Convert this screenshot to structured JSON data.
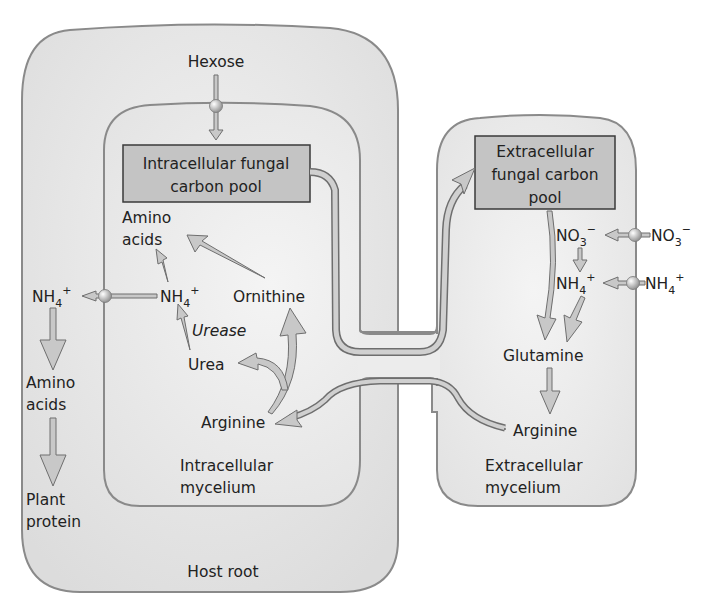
{
  "colors": {
    "host_fill": "#e4e4e4",
    "mycelium_fill": "#ececec",
    "outline": "#8a8a8a",
    "box_fill": "#c4c4c4",
    "box_border": "#3a3a3a",
    "arrow_fill": "#c8c8c8",
    "arrow_stroke": "#6e6e6e",
    "text": "#222222"
  },
  "regions": {
    "host_root": "Host root",
    "intracellular_mycelium": [
      "Intracellular",
      "mycelium"
    ],
    "extracellular_mycelium": [
      "Extracellular",
      "mycelium"
    ]
  },
  "boxes": {
    "intracellular_pool": [
      "Intracellular fungal",
      "carbon pool"
    ],
    "extracellular_pool": [
      "Extracellular",
      "fungal carbon",
      "pool"
    ]
  },
  "labels": {
    "hexose": "Hexose",
    "amino_acids_fungal": [
      "Amino",
      "acids"
    ],
    "nh4_intra": "NH",
    "nh4_host": "NH",
    "ornithine": "Ornithine",
    "urease": "Urease",
    "urea": "Urea",
    "arginine_intra": "Arginine",
    "amino_acids_plant": [
      "Amino",
      "acids"
    ],
    "plant_protein": [
      "Plant",
      "protein"
    ],
    "no3_inside": "NO",
    "no3_outside": "NO",
    "nh4_extra_inside": "NH",
    "nh4_extra_outside": "NH",
    "glutamine": "Glutamine",
    "arginine_extra": "Arginine"
  },
  "subscripts": {
    "nh4": "4",
    "no3": "3",
    "plus": "+",
    "minus": "−"
  }
}
